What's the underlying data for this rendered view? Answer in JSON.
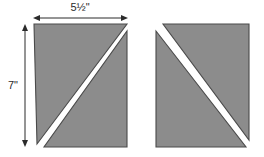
{
  "diagram": {
    "background_color": "#ffffff",
    "shape_fill_color": "#8c8c8c",
    "shape_outline_color": "#4a4a4a",
    "gap_color": "#ffffff",
    "dimension_line_color": "#2b2b2b",
    "dimensions": {
      "width_label": "5½\"",
      "height_label": "7\""
    },
    "shapes": [
      {
        "name": "left-rectangle",
        "width_inches": "5½\"",
        "height_inches": "7\"",
        "diagonal_direction": "bottom-left-to-top-right",
        "pieces": [
          {
            "name": "upper-left-triangle"
          },
          {
            "name": "lower-right-triangle"
          }
        ]
      },
      {
        "name": "right-rectangle",
        "width_inches": "5½\"",
        "height_inches": "7\"",
        "diagonal_direction": "top-left-to-bottom-right",
        "pieces": [
          {
            "name": "upper-right-triangle"
          },
          {
            "name": "lower-left-triangle"
          }
        ]
      }
    ]
  }
}
